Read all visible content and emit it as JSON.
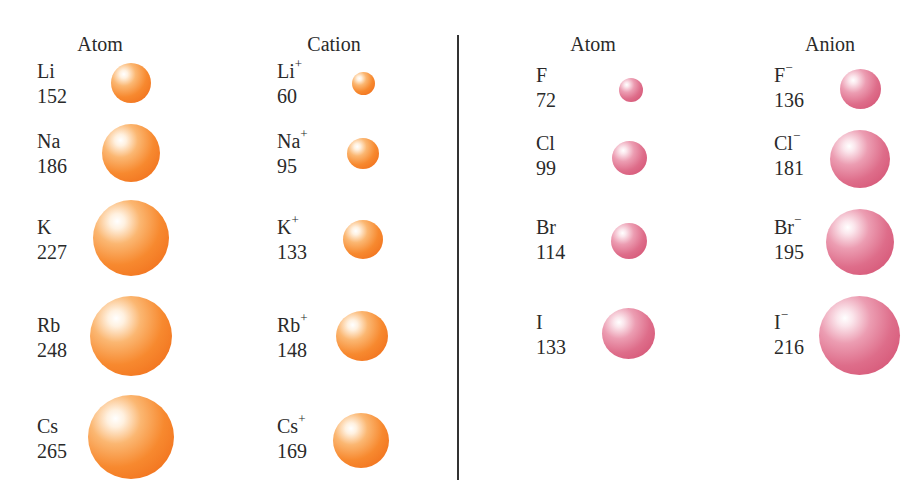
{
  "headers": {
    "alkali_atom": "Atom",
    "cation": "Cation",
    "halogen_atom": "Atom",
    "anion": "Anion"
  },
  "colors": {
    "cation_group": "#f47d2a",
    "anion_group": "#dc6684"
  },
  "alkali_atoms": [
    {
      "symbol": "Li",
      "charge": "",
      "radius": "152"
    },
    {
      "symbol": "Na",
      "charge": "",
      "radius": "186"
    },
    {
      "symbol": "K",
      "charge": "",
      "radius": "227"
    },
    {
      "symbol": "Rb",
      "charge": "",
      "radius": "248"
    },
    {
      "symbol": "Cs",
      "charge": "",
      "radius": "265"
    }
  ],
  "cations": [
    {
      "symbol": "Li",
      "charge": "+",
      "radius": "60"
    },
    {
      "symbol": "Na",
      "charge": "+",
      "radius": "95"
    },
    {
      "symbol": "K",
      "charge": "+",
      "radius": "133"
    },
    {
      "symbol": "Rb",
      "charge": "+",
      "radius": "148"
    },
    {
      "symbol": "Cs",
      "charge": "+",
      "radius": "169"
    }
  ],
  "halogen_atoms": [
    {
      "symbol": "F",
      "charge": "",
      "radius": "72"
    },
    {
      "symbol": "Cl",
      "charge": "",
      "radius": "99"
    },
    {
      "symbol": "Br",
      "charge": "",
      "radius": "114"
    },
    {
      "symbol": "I",
      "charge": "",
      "radius": "133"
    }
  ],
  "anions": [
    {
      "symbol": "F",
      "charge": "−",
      "radius": "136"
    },
    {
      "symbol": "Cl",
      "charge": "−",
      "radius": "181"
    },
    {
      "symbol": "Br",
      "charge": "−",
      "radius": "195"
    },
    {
      "symbol": "I",
      "charge": "−",
      "radius": "216"
    }
  ]
}
